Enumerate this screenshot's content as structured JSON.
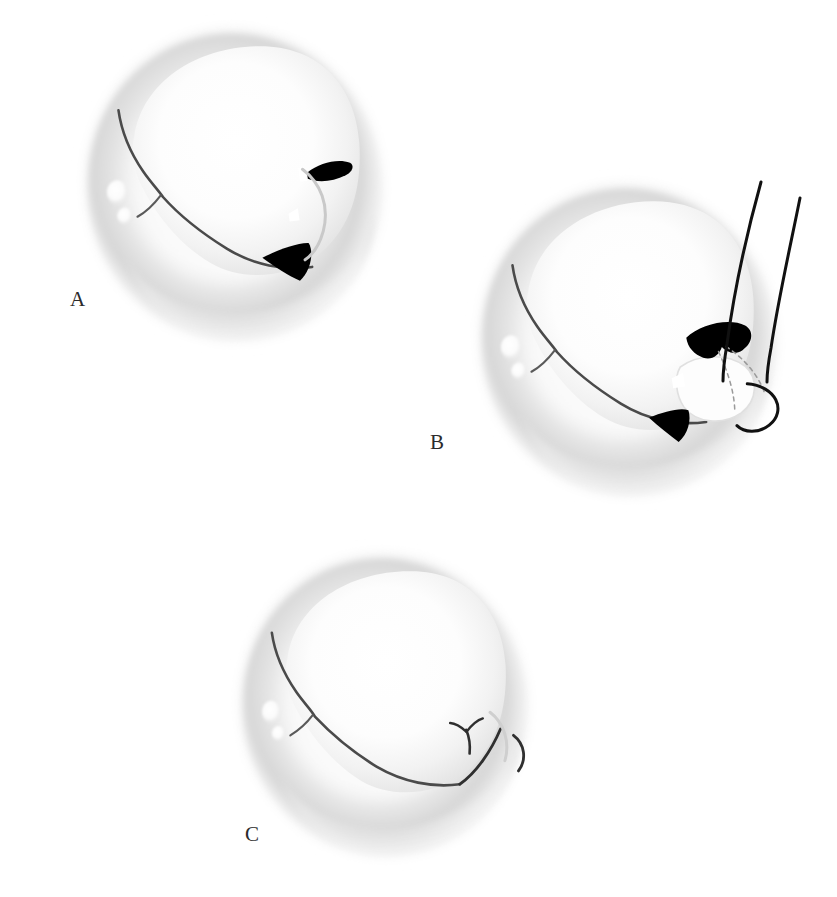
{
  "document": {
    "kind": "anatomical-illustration",
    "subject": "Surgical repair of a cleft in an atrioventricular valve leaflet",
    "technique": "grayscale airbrush / stipple medical illustration",
    "background_color": "#ffffff",
    "width": 837,
    "height": 897
  },
  "palette": {
    "background": "#ffffff",
    "tissue_highlight": "#ffffff",
    "tissue_light": "#f7f7f7",
    "tissue_mid": "#eeeeee",
    "annulus_ring": "#e2e2e2",
    "annulus_shadow": "#d4d4d4",
    "outer_halo": "#ededed",
    "ink_line": "#2b2b2b",
    "cleft_black": "#000000",
    "suture_thread": "#111111",
    "dashed_suture": "#8a8a8a",
    "label_text": "#2b2b2b",
    "caption_text": "#d8d8d8"
  },
  "panels": [
    {
      "id": "a",
      "label": "A",
      "label_position": {
        "x": 70,
        "y": 289
      },
      "center": {
        "x": 234,
        "y": 185
      },
      "radius_x": 155,
      "radius_y": 163,
      "rotation_deg": -8,
      "caption_role": "Pre-repair: valve viewed from the atrium showing the open cleft defect",
      "features": [
        "annulus ring",
        "anterior leaflet body",
        "coaptation line",
        "cleft defect (black)",
        "secondary black triangular gap",
        "small white commissural notch",
        "bright papillary highlight nodule on left annulus"
      ],
      "has_sutures": false,
      "has_cleft_open": true
    },
    {
      "id": "b",
      "label": "B",
      "label_position": {
        "x": 430,
        "y": 432
      },
      "center": {
        "x": 628,
        "y": 340
      },
      "radius_x": 155,
      "radius_y": 163,
      "rotation_deg": -8,
      "caption_role": "Sutures placed across the cleft; needle and thread pass through leaflet edges",
      "features": [
        "annulus ring",
        "anterior leaflet body",
        "coaptation line",
        "cleft defect (black)",
        "two long suture threads exiting superiorly",
        "dashed sub-surface suture tracks",
        "curved needle loop at lower right",
        "bright papillary highlight nodule on left annulus"
      ],
      "has_sutures": true,
      "has_cleft_open": true,
      "suture_count": 2
    },
    {
      "id": "c",
      "label": "C",
      "label_position": {
        "x": 245,
        "y": 824
      },
      "center": {
        "x": 384,
        "y": 705
      },
      "radius_x": 150,
      "radius_y": 158,
      "rotation_deg": -8,
      "caption_role": "Post-repair: cleft closed, competent coaptation line restored",
      "features": [
        "annulus ring",
        "anterior leaflet body",
        "restored coaptation line",
        "closed cleft shown as Y-shaped suture line",
        "small curved residual mark at right margin",
        "bright papillary highlight nodule on left annulus"
      ],
      "has_sutures": false,
      "has_cleft_open": false
    }
  ],
  "caption": {
    "visible": true,
    "clipped": true,
    "text": "",
    "note": "Caption row is cropped at the bottom edge of the page; only the faint upper pixel row of the glyphs is visible."
  }
}
